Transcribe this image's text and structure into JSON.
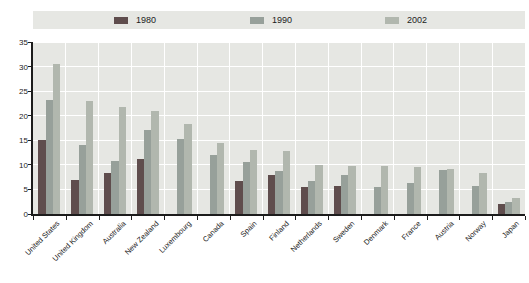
{
  "chart_data": {
    "type": "bar",
    "title": "",
    "xlabel": "",
    "ylabel": "",
    "categories": [
      "United States",
      "United Kingdom",
      "Australia",
      "New Zealand",
      "Luxembourg",
      "Canada",
      "Spain",
      "Finland",
      "Netherlands",
      "Sweden",
      "Denmark",
      "France",
      "Austria",
      "Norway",
      "Japan"
    ],
    "series": [
      {
        "name": "1980",
        "color": "#5f4d4d",
        "values": [
          15.0,
          7.0,
          8.3,
          11.1,
          null,
          null,
          6.8,
          7.9,
          5.5,
          5.7,
          null,
          null,
          null,
          null,
          2.1
        ]
      },
      {
        "name": "1990",
        "color": "#97a09a",
        "values": [
          23.3,
          14.0,
          10.8,
          17.0,
          15.2,
          12.1,
          10.6,
          8.7,
          6.7,
          8.0,
          5.5,
          6.3,
          8.9,
          5.6,
          2.4
        ]
      },
      {
        "name": "2002",
        "color": "#b1b7ae",
        "values": [
          30.6,
          23.0,
          21.7,
          20.9,
          18.4,
          14.4,
          13.1,
          12.8,
          10.0,
          9.7,
          9.8,
          9.6,
          9.1,
          8.3,
          3.3
        ]
      }
    ],
    "ylim": [
      0,
      35
    ],
    "yticks": [
      0,
      5,
      10,
      15,
      20,
      25,
      30,
      35
    ],
    "grid": true,
    "legend_position": "top",
    "plot_bg": "#e6e7e3",
    "grid_color": "#ffffff",
    "axis_color": "#1c1c1c"
  }
}
